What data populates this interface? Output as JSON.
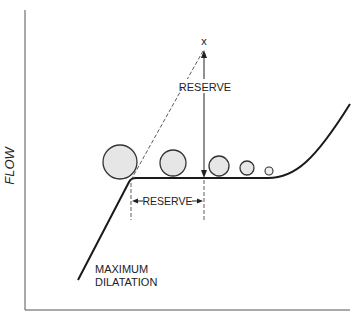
{
  "diagram": {
    "y_axis_label": "FLOW",
    "x_mark": "x",
    "vertical_reserve_label": "RESERVE",
    "horizontal_reserve_label": "RESERVE",
    "max_dilatation_line1": "MAXIMUM",
    "max_dilatation_line2": "DILATATION",
    "circles": [
      {
        "cx": 120,
        "cy": 162,
        "r": 17
      },
      {
        "cx": 173,
        "cy": 163,
        "r": 13
      },
      {
        "cx": 219,
        "cy": 166,
        "r": 10
      },
      {
        "cx": 247,
        "cy": 168,
        "r": 7
      },
      {
        "cx": 269,
        "cy": 171,
        "r": 4
      }
    ],
    "colors": {
      "line": "#1a1a1a",
      "circle_fill": "#e6e6e6",
      "circle_stroke": "#333333",
      "axis": "#555555"
    }
  }
}
